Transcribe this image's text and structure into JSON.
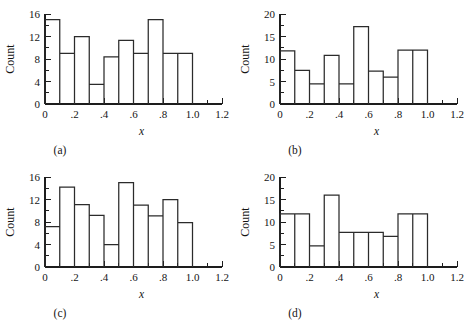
{
  "figure": {
    "panel_count": 4,
    "background_color": "#ffffff",
    "line_color": "#2b2b2b"
  },
  "chart_data": [
    {
      "type": "bar",
      "panel_tag": "(a)",
      "title": "",
      "xlabel": "x",
      "ylabel": "Count",
      "bin_edges": [
        0.0,
        0.1,
        0.2,
        0.3,
        0.4,
        0.5,
        0.6,
        0.7,
        0.8,
        0.9,
        1.0
      ],
      "categories": [
        "0.0-0.1",
        "0.1-0.2",
        "0.2-0.3",
        "0.3-0.4",
        "0.4-0.5",
        "0.5-0.6",
        "0.6-0.7",
        "0.7-0.8",
        "0.8-0.9",
        "0.9-1.0"
      ],
      "values": [
        15,
        9,
        12,
        3.5,
        8.4,
        11.3,
        9,
        15,
        9,
        9
      ],
      "xlim": [
        0,
        1.2
      ],
      "ylim": [
        0,
        16
      ],
      "x_ticks_major": [
        0,
        0.2,
        0.4,
        0.6,
        0.8,
        1.0,
        1.2
      ],
      "x_tick_labels": [
        "0",
        ".2",
        ".4",
        ".6",
        ".8",
        "1.0",
        "1.2"
      ],
      "x_ticks_minor": [
        0.1,
        0.3,
        0.5,
        0.7,
        0.9,
        1.1
      ],
      "y_ticks_major": [
        0,
        4,
        8,
        12,
        16
      ],
      "y_tick_labels": [
        "0",
        "4",
        "8",
        "12",
        "16"
      ],
      "y_ticks_minor": [
        2,
        6,
        10,
        14
      ],
      "grid": false,
      "legend": "none"
    },
    {
      "type": "bar",
      "panel_tag": "(b)",
      "title": "",
      "xlabel": "x",
      "ylabel": "Count",
      "bin_edges": [
        0.0,
        0.1,
        0.2,
        0.3,
        0.4,
        0.5,
        0.6,
        0.7,
        0.8,
        0.9,
        1.0
      ],
      "categories": [
        "0.0-0.1",
        "0.1-0.2",
        "0.2-0.3",
        "0.3-0.4",
        "0.4-0.5",
        "0.5-0.6",
        "0.6-0.7",
        "0.7-0.8",
        "0.8-0.9",
        "0.9-1.0"
      ],
      "values": [
        11.8,
        7.5,
        4.5,
        10.8,
        4.5,
        17.2,
        7.3,
        6.0,
        12,
        12
      ],
      "xlim": [
        0,
        1.2
      ],
      "ylim": [
        0,
        20
      ],
      "x_ticks_major": [
        0,
        0.2,
        0.4,
        0.6,
        0.8,
        1.0,
        1.2
      ],
      "x_tick_labels": [
        "0",
        ".2",
        ".4",
        ".6",
        ".8",
        "1.0",
        "1.2"
      ],
      "x_ticks_minor": [
        0.1,
        0.3,
        0.5,
        0.7,
        0.9,
        1.1
      ],
      "y_ticks_major": [
        0,
        5,
        10,
        15,
        20
      ],
      "y_tick_labels": [
        "0",
        "5",
        "10",
        "15",
        "20"
      ],
      "y_ticks_minor": [
        2.5,
        7.5,
        12.5,
        17.5
      ],
      "grid": false,
      "legend": "none"
    },
    {
      "type": "bar",
      "panel_tag": "(c)",
      "title": "",
      "xlabel": "x",
      "ylabel": "Count",
      "bin_edges": [
        0.0,
        0.1,
        0.2,
        0.3,
        0.4,
        0.5,
        0.6,
        0.7,
        0.8,
        0.9,
        1.0
      ],
      "categories": [
        "0.0-0.1",
        "0.1-0.2",
        "0.2-0.3",
        "0.3-0.4",
        "0.4-0.5",
        "0.5-0.6",
        "0.6-0.7",
        "0.7-0.8",
        "0.8-0.9",
        "0.9-1.0"
      ],
      "values": [
        7.2,
        14.2,
        11.1,
        9.2,
        4.0,
        15.0,
        11.0,
        9.1,
        12.0,
        7.9
      ],
      "xlim": [
        0,
        1.2
      ],
      "ylim": [
        0,
        16
      ],
      "x_ticks_major": [
        0,
        0.2,
        0.4,
        0.6,
        0.8,
        1.0,
        1.2
      ],
      "x_tick_labels": [
        "0",
        ".2",
        ".4",
        ".6",
        ".8",
        "1.0",
        "1.2"
      ],
      "x_ticks_minor": [
        0.1,
        0.3,
        0.5,
        0.7,
        0.9,
        1.1
      ],
      "y_ticks_major": [
        0,
        4,
        8,
        12,
        16
      ],
      "y_tick_labels": [
        "0",
        "4",
        "8",
        "12",
        "16"
      ],
      "y_ticks_minor": [
        2,
        6,
        10,
        14
      ],
      "grid": false,
      "legend": "none"
    },
    {
      "type": "bar",
      "panel_tag": "(d)",
      "title": "",
      "xlabel": "x",
      "ylabel": "Count",
      "bin_edges": [
        0.0,
        0.1,
        0.2,
        0.3,
        0.4,
        0.5,
        0.6,
        0.7,
        0.8,
        0.9,
        1.0
      ],
      "categories": [
        "0.0-0.1",
        "0.1-0.2",
        "0.2-0.3",
        "0.3-0.4",
        "0.4-0.5",
        "0.5-0.6",
        "0.6-0.7",
        "0.7-0.8",
        "0.8-0.9",
        "0.9-1.0"
      ],
      "values": [
        11.8,
        11.8,
        4.7,
        16.0,
        7.7,
        7.7,
        7.7,
        6.8,
        11.8,
        11.8
      ],
      "xlim": [
        0,
        1.2
      ],
      "ylim": [
        0,
        20
      ],
      "x_ticks_major": [
        0,
        0.2,
        0.4,
        0.6,
        0.8,
        1.0,
        1.2
      ],
      "x_tick_labels": [
        "0",
        ".2",
        ".4",
        ".6",
        ".8",
        "1.0",
        "1.2"
      ],
      "x_ticks_minor": [
        0.1,
        0.3,
        0.5,
        0.7,
        0.9,
        1.1
      ],
      "y_ticks_major": [
        0,
        5,
        10,
        15,
        20
      ],
      "y_tick_labels": [
        "0",
        "5",
        "10",
        "15",
        "20"
      ],
      "y_ticks_minor": [
        2.5,
        7.5,
        12.5,
        17.5
      ],
      "grid": false,
      "legend": "none"
    }
  ]
}
